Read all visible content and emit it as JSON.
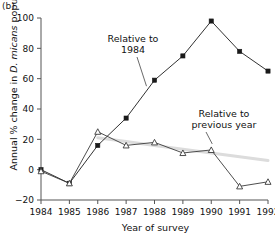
{
  "panel": {
    "label": "(b)"
  },
  "chart_data": {
    "type": "line",
    "title": "",
    "xlabel": "Year of survey",
    "ylabel": "Annual % change in D. micans populations",
    "ylabel_plain_prefix": "Annual % change in ",
    "ylabel_italic": "D. micans",
    "ylabel_plain_suffix": " populations",
    "categories": [
      "1984",
      "1985",
      "1986",
      "1987",
      "1988",
      "1989",
      "1990",
      "1991",
      "1992"
    ],
    "x": [
      1984,
      1985,
      1986,
      1987,
      1988,
      1989,
      1990,
      1991,
      1992
    ],
    "xlim": [
      1984,
      1992
    ],
    "ylim": [
      -20,
      100
    ],
    "yticks": [
      -20,
      0,
      20,
      40,
      60,
      80,
      100
    ],
    "ytick_labels": [
      "−20",
      "0",
      "20",
      "40",
      "60",
      "80",
      "100"
    ],
    "xticks": [
      1984,
      1985,
      1986,
      1987,
      1988,
      1989,
      1990,
      1991,
      1992
    ],
    "grid": false,
    "legend": "annotations",
    "series": [
      {
        "name": "Relative to 1984",
        "marker": "filled-square",
        "color": "#1a1a1a",
        "values": [
          0,
          -9,
          16,
          34,
          59,
          75,
          98,
          78,
          65
        ]
      },
      {
        "name": "Relative to previous year",
        "marker": "open-triangle",
        "color": "#3a3a3a",
        "values": [
          -1,
          -9,
          25,
          16,
          18,
          11,
          13,
          -11,
          -8
        ]
      },
      {
        "name": "trend",
        "marker": "none",
        "color": "#dcdcdc",
        "style": "trendline",
        "values": [
          null,
          null,
          21,
          18.5,
          16,
          13.5,
          11,
          8.5,
          6
        ]
      }
    ],
    "annotations": [
      {
        "text_line1": "Relative to",
        "text_line2": "1984",
        "target_series": "Relative to 1984"
      },
      {
        "text_line1": "Relative to",
        "text_line2": "previous year",
        "target_series": "Relative to previous year"
      }
    ]
  },
  "colors": {
    "axis": "#555555",
    "series_primary": "#1a1a1a",
    "series_secondary": "#3a3a3a",
    "trend": "#dcdcdc",
    "background": "#ffffff"
  }
}
